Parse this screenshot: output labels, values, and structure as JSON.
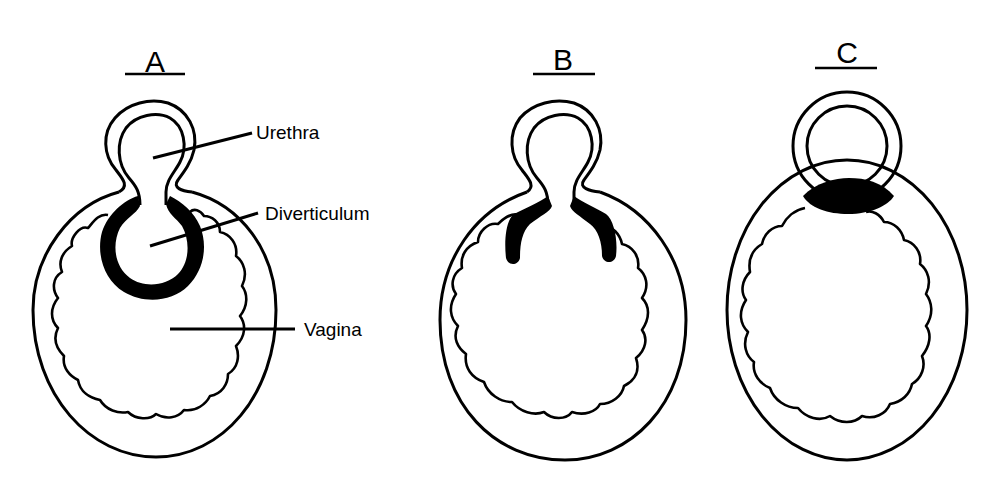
{
  "figure": {
    "panels": [
      {
        "id": "A",
        "label": "A"
      },
      {
        "id": "B",
        "label": "B"
      },
      {
        "id": "C",
        "label": "C"
      }
    ],
    "callouts": [
      {
        "panel": "A",
        "text": "Urethra"
      },
      {
        "panel": "A",
        "text": "Diverticulum"
      },
      {
        "panel": "A",
        "text": "Vagina"
      }
    ],
    "colors": {
      "ink": "#000000",
      "background": "#ffffff"
    }
  }
}
